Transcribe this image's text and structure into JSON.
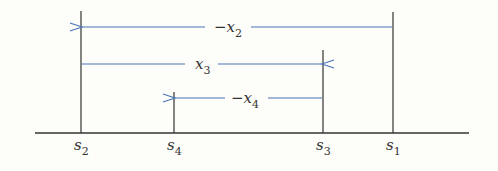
{
  "diagram": {
    "type": "displacement-number-line",
    "colors": {
      "axis": "#333333",
      "arrow": "#4a74b8",
      "text": "#333333",
      "background": "#fdfdf9"
    },
    "points": [
      {
        "id": "s2",
        "base": "s",
        "sub": "2",
        "order": 1
      },
      {
        "id": "s4",
        "base": "s",
        "sub": "4",
        "order": 2
      },
      {
        "id": "s3",
        "base": "s",
        "sub": "3",
        "order": 3
      },
      {
        "id": "s1",
        "base": "s",
        "sub": "1",
        "order": 4
      }
    ],
    "arrows": [
      {
        "id": "neg-x2",
        "sign": "−",
        "base": "x",
        "sub": "2",
        "from": "s1",
        "to": "s2",
        "direction": "left"
      },
      {
        "id": "x3",
        "sign": "",
        "base": "x",
        "sub": "3",
        "from": "s2",
        "to": "s3",
        "direction": "right"
      },
      {
        "id": "neg-x4",
        "sign": "−",
        "base": "x",
        "sub": "4",
        "from": "s3",
        "to": "s4",
        "direction": "left"
      }
    ]
  }
}
